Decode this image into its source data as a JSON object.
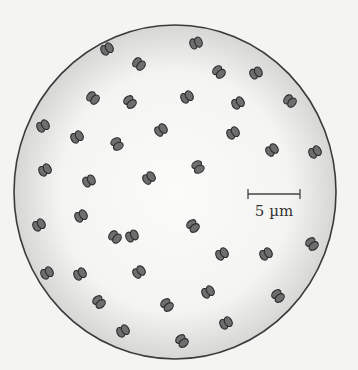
{
  "figure": {
    "field": {
      "cx": 175,
      "cy": 192,
      "rx": 161,
      "ry": 167
    },
    "colors": {
      "background": "#f4f4f3",
      "field_center": "#fbfbfa",
      "field_edge": "#d9d9d8",
      "outline": "#3a3a3a",
      "cell_fill": "#6e6e6e",
      "cell_stroke": "#2c2c2c"
    },
    "scale_bar": {
      "label": "5 µm",
      "x1": 248,
      "x2": 300,
      "y": 194
    },
    "cells": [
      {
        "x": 107,
        "y": 49,
        "a": -30
      },
      {
        "x": 139,
        "y": 64,
        "a": 40
      },
      {
        "x": 196,
        "y": 43,
        "a": -20
      },
      {
        "x": 219,
        "y": 72,
        "a": 45
      },
      {
        "x": 256,
        "y": 73,
        "a": -25
      },
      {
        "x": 93,
        "y": 98,
        "a": 40
      },
      {
        "x": 130,
        "y": 102,
        "a": 50
      },
      {
        "x": 187,
        "y": 97,
        "a": -30
      },
      {
        "x": 238,
        "y": 103,
        "a": -30
      },
      {
        "x": 290,
        "y": 101,
        "a": 40
      },
      {
        "x": 43,
        "y": 126,
        "a": -30
      },
      {
        "x": 77,
        "y": 137,
        "a": -30
      },
      {
        "x": 117,
        "y": 144,
        "a": 60
      },
      {
        "x": 161,
        "y": 130,
        "a": -35
      },
      {
        "x": 233,
        "y": 133,
        "a": -30
      },
      {
        "x": 272,
        "y": 150,
        "a": -35
      },
      {
        "x": 315,
        "y": 152,
        "a": -30
      },
      {
        "x": 45,
        "y": 170,
        "a": -30
      },
      {
        "x": 89,
        "y": 181,
        "a": -25
      },
      {
        "x": 149,
        "y": 178,
        "a": -35
      },
      {
        "x": 198,
        "y": 167,
        "a": 60
      },
      {
        "x": 81,
        "y": 216,
        "a": -30
      },
      {
        "x": 39,
        "y": 225,
        "a": -30
      },
      {
        "x": 193,
        "y": 226,
        "a": 50
      },
      {
        "x": 115,
        "y": 237,
        "a": 40
      },
      {
        "x": 132,
        "y": 236,
        "a": -25
      },
      {
        "x": 222,
        "y": 254,
        "a": -30
      },
      {
        "x": 266,
        "y": 254,
        "a": -30
      },
      {
        "x": 312,
        "y": 244,
        "a": 50
      },
      {
        "x": 47,
        "y": 273,
        "a": -30
      },
      {
        "x": 80,
        "y": 274,
        "a": -30
      },
      {
        "x": 139,
        "y": 272,
        "a": -35
      },
      {
        "x": 208,
        "y": 292,
        "a": -30
      },
      {
        "x": 99,
        "y": 302,
        "a": 50
      },
      {
        "x": 167,
        "y": 305,
        "a": 50
      },
      {
        "x": 278,
        "y": 296,
        "a": 50
      },
      {
        "x": 226,
        "y": 323,
        "a": -30
      },
      {
        "x": 123,
        "y": 331,
        "a": -30
      },
      {
        "x": 182,
        "y": 341,
        "a": 50
      }
    ]
  }
}
